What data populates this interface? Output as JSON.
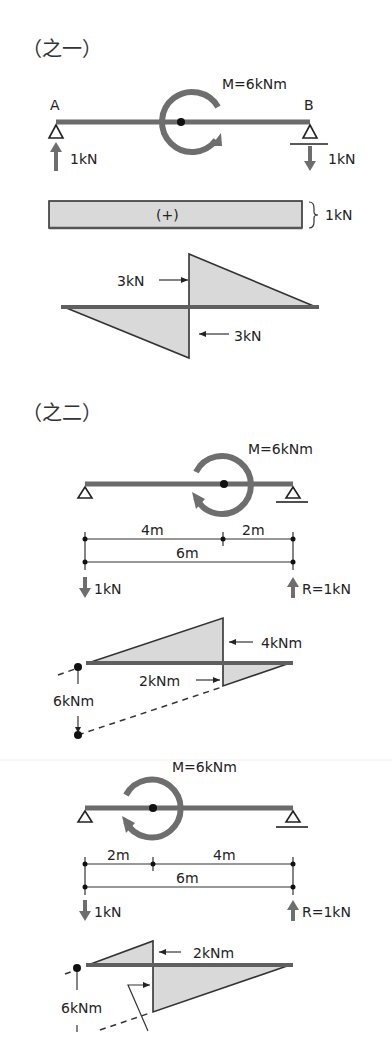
{
  "section1": {
    "title": "（之一）",
    "beam": {
      "left_label": "A",
      "right_label": "B",
      "moment_label": "M=6kNm",
      "left_reaction": "1kN",
      "right_reaction": "1kN"
    },
    "shear_bar": {
      "sign": "(+)",
      "value": "1kN"
    },
    "moment_diagram": {
      "upper_label": "3kN",
      "lower_label": "3kN"
    }
  },
  "section2": {
    "title": "（之二）",
    "case_a": {
      "moment_label": "M=6kNm",
      "dim_left": "4m",
      "dim_right": "2m",
      "dim_total": "6m",
      "left_reaction": "1kN",
      "right_reaction": "R=1kN",
      "diagram": {
        "upper_label": "4kNm",
        "lower_label": "2kNm",
        "side_label": "6kNm"
      }
    },
    "case_b": {
      "moment_label": "M=6kNm",
      "dim_left": "2m",
      "dim_right": "4m",
      "dim_total": "6m",
      "left_reaction": "1kN",
      "right_reaction": "R=1kN",
      "diagram": {
        "upper_label": "2kNm",
        "side_label": "6kNm"
      }
    }
  }
}
